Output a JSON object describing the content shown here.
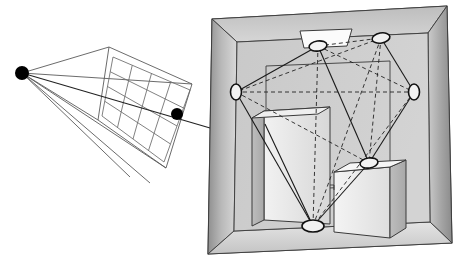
{
  "figure": {
    "background_color": "#ffffff",
    "width": 458,
    "height": 261
  },
  "palette": {
    "line": "#1a1a1a",
    "thin_line": "#555555",
    "node_fill": "#f2f2f2",
    "node_stroke": "#111111",
    "eye_fill": "#000000",
    "wall_left_light": "#d8d8d8",
    "wall_left_dark": "#9a9a9a",
    "wall_right_light": "#cfcfcf",
    "wall_right_dark": "#8e8e8e",
    "ceiling_light": "#d4d4d4",
    "ceiling_dark": "#bdbdbd",
    "floor_light": "#e2e2e2",
    "floor_dark": "#c6c6c6",
    "back_wall": "#cccccc",
    "box_front": "#e9e9e9",
    "box_side": "#bcbcbc",
    "box_top": "#f4f4f4",
    "lamp_fill": "#fbfbfb",
    "outer_frame": "#b4b4b4"
  },
  "eye": {
    "label": "eye-point",
    "x": 22,
    "y": 73,
    "radius": 7
  },
  "image_plane": {
    "label": "image-plane-grid",
    "columns": 4,
    "rows": 4,
    "corners": {
      "top_left": [
        109,
        47
      ],
      "top_right": [
        192,
        84
      ],
      "bottom_right": [
        166,
        168
      ],
      "bottom_left": [
        98,
        120
      ]
    },
    "pixel_marker": {
      "label": "sample-pixel",
      "x": 177,
      "y": 114,
      "radius": 6
    }
  },
  "frustum": {
    "label": "view-frustum",
    "rays_from_eye": 5
  },
  "primary_ray": {
    "label": "primary-ray",
    "from": [
      22,
      73
    ],
    "through": [
      177,
      114
    ],
    "to": [
      330,
      160
    ]
  },
  "room": {
    "label": "cornell-box-room",
    "outer_frame": {
      "top_left": [
        212,
        19
      ],
      "top_right": [
        447,
        6
      ],
      "bottom_right": [
        452,
        243
      ],
      "bottom_left": [
        208,
        254
      ]
    },
    "back_wall": {
      "top_left": [
        237,
        42
      ],
      "top_right": [
        428,
        33
      ],
      "bottom_right": [
        430,
        222
      ],
      "bottom_left": [
        234,
        231
      ]
    }
  },
  "objects": [
    {
      "label": "tall-block",
      "kind": "box"
    },
    {
      "label": "short-block",
      "kind": "box"
    },
    {
      "label": "ceiling-lamp-panel",
      "kind": "area-light"
    }
  ],
  "nodes": [
    {
      "label": "node-ceiling-left",
      "x": 318,
      "y": 46,
      "rx": 9,
      "ry": 5,
      "rot": -8
    },
    {
      "label": "node-ceiling-right",
      "x": 381,
      "y": 38,
      "rx": 9,
      "ry": 5,
      "rot": -10
    },
    {
      "label": "node-wall-left",
      "x": 236,
      "y": 92,
      "rx": 6,
      "ry": 8,
      "rot": 0
    },
    {
      "label": "node-wall-right",
      "x": 414,
      "y": 92,
      "rx": 6,
      "ry": 8,
      "rot": 0
    },
    {
      "label": "node-box-top",
      "x": 369,
      "y": 163,
      "rx": 9,
      "ry": 5,
      "rot": -8
    },
    {
      "label": "node-floor",
      "x": 313,
      "y": 226,
      "rx": 11,
      "ry": 6,
      "rot": 0
    }
  ],
  "links": {
    "solid_label": "visible-link",
    "dashed_label": "occluded-link",
    "solid_count": 7,
    "dashed_count": 8
  }
}
